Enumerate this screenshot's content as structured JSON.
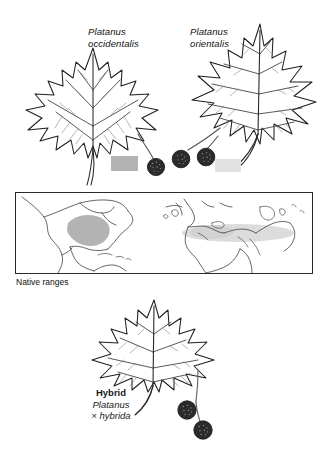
{
  "figure": {
    "title_visible": false,
    "background": "#ffffff",
    "ink_color": "#1a1a1a"
  },
  "species": [
    {
      "id": "occidentalis",
      "label_line1": "Platanus",
      "label_line2": "occidentalis",
      "common_region": "eastern North America",
      "seed_ball_count": 1,
      "swatch_color": "#b3b3b3",
      "leaf_form": "broad, shallowly lobed"
    },
    {
      "id": "orientalis",
      "label_line1": "Platanus",
      "label_line2": "orientalis",
      "common_region": "Mediterranean to Near East",
      "seed_ball_count": 2,
      "swatch_color": "#e2e2e2",
      "leaf_form": "deeply cut, narrow pointed lobes"
    }
  ],
  "map": {
    "caption": "Native ranges",
    "border_color": "#2a2a2a",
    "coastline_color": "#5a5a5a",
    "ranges": [
      {
        "name": "Platanus occidentalis native range",
        "color": "#b3b3b3"
      },
      {
        "name": "Platanus orientalis native range",
        "color": "#dcdcdc"
      }
    ]
  },
  "hybrid": {
    "label_line1": "Hybrid",
    "label_line2": "Platanus",
    "label_line3": "× hybrida",
    "seed_ball_count": 2,
    "leaf_form": "intermediate between parents"
  }
}
